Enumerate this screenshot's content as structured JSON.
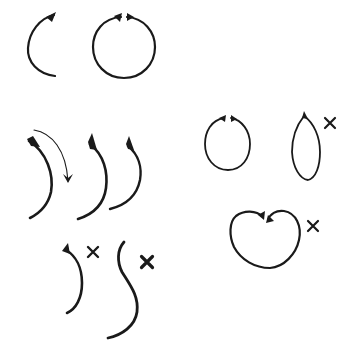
{
  "diagram": {
    "title": "Brush stroke exercises: curves, circles and incorrect forms",
    "ink_color": "#1a1a1a",
    "background": "#ffffff",
    "groups": [
      {
        "id": "open-arc",
        "description": "Single left-curving arc with arrowhead at top",
        "strokes": [
          {
            "d": "M54,15 C40,18 29,32 28,48 C27,62 38,74 55,76",
            "width": 2.2
          }
        ],
        "heads": [
          {
            "d": "M46,17 L56,12 L52,22 Z"
          }
        ],
        "marks": []
      },
      {
        "id": "full-circle",
        "description": "Complete circle formed by two strokes meeting at top",
        "strokes": [
          {
            "d": "M121,17 C103,18 93,32 93,47 C93,64 106,78 124,78 C142,78 155,64 155,47 C155,32 144,18 127,17",
            "width": 2.2
          }
        ],
        "heads": [
          {
            "d": "M114,16 L122,13 L120,22 Z"
          },
          {
            "d": "M127,13 L134,17 L127,21 Z"
          }
        ],
        "marks": []
      },
      {
        "id": "curve-direction",
        "description": "Thin arrow showing downward stroke direction",
        "strokes": [
          {
            "d": "M34,130 C52,133 66,150 68,181",
            "width": 1.1
          }
        ],
        "heads": [
          {
            "d": "M63,174 L68,183 L73,174 L68,178 Z"
          }
        ],
        "marks": []
      },
      {
        "id": "right-curves",
        "description": "Three right-bulging tapered strokes",
        "strokes": [
          {
            "d": "M29,141 C47,152 54,175 51,192 C48,205 40,213 30,218",
            "width": 2.6
          },
          {
            "d": "M90,144 C104,155 108,172 106,188 C104,203 94,214 78,219",
            "width": 2.6
          },
          {
            "d": "M128,146 C139,155 142,168 140,180 C137,195 126,205 110,209",
            "width": 2.4
          }
        ],
        "heads": [
          {
            "d": "M27,139 L33,136 L40,147 L31,146 Z"
          },
          {
            "d": "M88,142 L92,133 L97,150 L90,149 Z"
          },
          {
            "d": "M126,144 L129,136 L134,150 L128,149 Z"
          }
        ],
        "marks": []
      },
      {
        "id": "hook-incorrect",
        "description": "Small hooked stroke marked incorrect",
        "strokes": [
          {
            "d": "M66,250 C76,256 82,268 82,283 C82,298 76,309 67,313",
            "width": 2.6
          }
        ],
        "heads": [
          {
            "d": "M62,251 L68,243 L70,254 Z"
          }
        ],
        "marks": [
          {
            "x": 93,
            "y": 252,
            "size": 10,
            "width": 2.4
          }
        ]
      },
      {
        "id": "s-curve-incorrect",
        "description": "Long S-shaped stroke marked incorrect",
        "strokes": [
          {
            "d": "M124,242 C117,250 117,262 122,272 C130,285 139,296 137,312 C135,326 122,335 108,338",
            "width": 2.8
          }
        ],
        "heads": [],
        "marks": [
          {
            "x": 147,
            "y": 262,
            "size": 11,
            "width": 3.2
          }
        ]
      },
      {
        "id": "small-circle",
        "description": "Small circle formed by two strokes meeting at top",
        "strokes": [
          {
            "d": "M224,118 C211,120 205,132 205,144 C205,158 214,170 228,170 C242,170 250,158 250,144 C250,131 242,120 231,118",
            "width": 1.8
          }
        ],
        "heads": [
          {
            "d": "M219,118 L226,115 L225,122 Z"
          },
          {
            "d": "M231,115 L237,119 L231,122 Z"
          }
        ],
        "marks": []
      },
      {
        "id": "narrow-oval-incorrect",
        "description": "Pointed narrow oval marked incorrect",
        "strokes": [
          {
            "d": "M304,116 C296,126 292,140 292,152 C293,168 300,179 308,180 C316,178 320,166 320,152 C320,137 314,123 304,116",
            "width": 1.8
          }
        ],
        "heads": [
          {
            "d": "M302,118 L304,111 L308,119 Z"
          }
        ],
        "marks": [
          {
            "x": 330,
            "y": 123,
            "size": 10,
            "width": 2.2
          }
        ]
      },
      {
        "id": "heart-incorrect",
        "description": "Heart-shaped form with dipped top marked incorrect",
        "strokes": [
          {
            "d": "M263,217 C256,210 244,210 236,216 C229,222 229,236 234,247 C241,260 255,268 270,268 C284,267 296,254 299,240 C302,226 296,213 284,211 C276,210 270,214 268,220",
            "width": 2.2
          }
        ],
        "heads": [
          {
            "d": "M258,215 L265,211 L264,220 Z"
          },
          {
            "d": "M266,223 L268,215 L274,221 Z"
          }
        ],
        "marks": [
          {
            "x": 313,
            "y": 226,
            "size": 10,
            "width": 2.2
          }
        ]
      }
    ]
  }
}
